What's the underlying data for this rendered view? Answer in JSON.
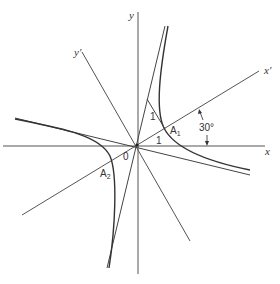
{
  "figure": {
    "axes": {
      "x_label": "x",
      "y_label": "y",
      "x_prime_label": "x′",
      "y_prime_label": "y′",
      "origin_label": "0"
    },
    "rotation": {
      "angle_label": "30°",
      "angle_degrees": 30
    },
    "vertices": [
      {
        "name": "A",
        "subscript": "1"
      },
      {
        "name": "A",
        "subscript": "2"
      }
    ],
    "segment_labels": [
      "1",
      "1"
    ]
  }
}
